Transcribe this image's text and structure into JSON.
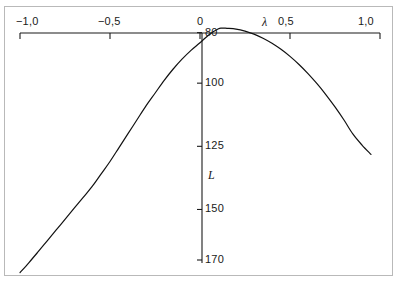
{
  "chart_data": {
    "type": "line",
    "title": "",
    "xlabel": "λ",
    "ylabel": "L",
    "xlim": [
      -1.0,
      1.0
    ],
    "ylim": [
      170,
      75
    ],
    "y_axis_inverted": true,
    "grid": false,
    "legend": null,
    "x_ticks": [
      {
        "value": -1.0,
        "label": "−1,0"
      },
      {
        "value": -0.5,
        "label": "−0,5"
      },
      {
        "value": 0.0,
        "label": "0"
      },
      {
        "value": 0.5,
        "label": "0,5"
      },
      {
        "value": 1.0,
        "label": "1,0"
      }
    ],
    "y_ticks": [
      {
        "value": 80,
        "label": "80"
      },
      {
        "value": 100,
        "label": "100"
      },
      {
        "value": 125,
        "label": "125"
      },
      {
        "value": 150,
        "label": "150"
      },
      {
        "value": 170,
        "label": "170"
      }
    ],
    "series": [
      {
        "name": "L(λ)",
        "x": [
          -1.0,
          -0.95,
          -0.9,
          -0.85,
          -0.8,
          -0.75,
          -0.7,
          -0.65,
          -0.6,
          -0.55,
          -0.5,
          -0.45,
          -0.4,
          -0.35,
          -0.3,
          -0.25,
          -0.2,
          -0.15,
          -0.1,
          -0.05,
          0.0,
          0.05,
          0.1,
          0.12,
          0.15,
          0.2,
          0.25,
          0.3,
          0.35,
          0.4,
          0.45,
          0.5,
          0.55,
          0.6,
          0.65,
          0.7,
          0.75,
          0.8,
          0.85,
          0.9,
          0.95
        ],
        "y": [
          175.0,
          171.0,
          166.8,
          162.5,
          158.2,
          153.9,
          149.6,
          145.3,
          141.0,
          136.0,
          131.0,
          125.5,
          120.0,
          114.5,
          109.0,
          104.0,
          99.0,
          94.5,
          90.5,
          87.0,
          84.0,
          80.8,
          78.6,
          78.2,
          78.3,
          78.6,
          79.4,
          80.6,
          82.2,
          84.2,
          86.6,
          89.4,
          92.6,
          96.2,
          100.2,
          104.6,
          109.4,
          114.6,
          120.2,
          124.5,
          128.2
        ]
      }
    ]
  },
  "axis_labels": {
    "lambda_symbol": "λ",
    "l_symbol": "L"
  }
}
